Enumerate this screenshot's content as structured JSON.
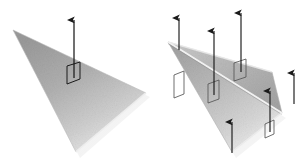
{
  "figure": {
    "background_color": "#ffffff",
    "width": 308,
    "height": 164,
    "panels": [
      {
        "name": "flat-surface-panel",
        "caption": "",
        "surface": {
          "name": "flat-triangle",
          "kind": "triangle",
          "fill_light": "#dcdcdc",
          "fill_dark": "#8d8d8d",
          "edge_color": "#b4b4b4",
          "vertices": [
            [
              13,
              30
            ],
            [
              146,
              93
            ],
            [
              76,
              152
            ]
          ]
        },
        "shadow": {
          "name": "triangle-drop-shadow",
          "color": "#e4e4e4",
          "vertices": [
            [
              18,
              36
            ],
            [
              150,
              97
            ],
            [
              80,
              158
            ]
          ]
        },
        "normals": [
          {
            "name": "normal-vector-1",
            "base": [
              74,
              76
            ],
            "tip": [
              74,
              13
            ],
            "length_px": 63,
            "color": "#1a1a1a"
          }
        ],
        "area_elements": [
          {
            "name": "area-element-1",
            "color": "#1a1a1a",
            "points": [
              [
                67,
                66
              ],
              [
                80,
                62
              ],
              [
                80,
                79
              ],
              [
                67,
                84
              ]
            ]
          }
        ]
      },
      {
        "name": "folded-surface-panel",
        "caption": "",
        "surface": {
          "name": "folded-surface",
          "kind": "two-facet-fold",
          "apex": [
            168,
            42
          ],
          "crease_end": [
            282,
            113
          ],
          "upper_facet": {
            "name": "upper-facet",
            "fill_light": "#d2d2d2",
            "fill_dark": "#9a9a9a",
            "vertices": [
              [
                168,
                42
              ],
              [
                282,
                113
              ],
              [
                272,
                73
              ]
            ]
          },
          "lower_facet": {
            "name": "lower-facet",
            "fill_light": "#e0e0e0",
            "fill_dark": "#8f8f8f",
            "vertices": [
              [
                168,
                42
              ],
              [
                282,
                113
              ],
              [
                232,
                152
              ]
            ]
          },
          "crease_color": "#f2f2f2",
          "edge_color": "#b0b0b0"
        },
        "shadow": {
          "name": "folded-drop-shadow",
          "color": "#e8e8e8",
          "vertices": [
            [
              172,
              48
            ],
            [
              286,
              118
            ],
            [
              236,
              158
            ]
          ]
        },
        "normals": [
          {
            "name": "normal-vector-1",
            "base": [
              179,
              48
            ],
            "tip": [
              179,
              11
            ],
            "length_px": 37,
            "color": "#1a1a1a"
          },
          {
            "name": "normal-vector-2",
            "base": [
              214,
              93
            ],
            "tip": [
              214,
              24
            ],
            "length_px": 69,
            "color": "#1a1a1a"
          },
          {
            "name": "normal-vector-3",
            "base": [
              241,
              70
            ],
            "tip": [
              241,
              6
            ],
            "length_px": 64,
            "color": "#1a1a1a"
          },
          {
            "name": "normal-vector-4",
            "base": [
              232,
              151
            ],
            "tip": [
              232,
              115
            ],
            "length_px": 36,
            "color": "#1a1a1a"
          },
          {
            "name": "normal-vector-5",
            "base": [
              270,
              130
            ],
            "tip": [
              270,
              84
            ],
            "length_px": 46,
            "color": "#1a1a1a"
          },
          {
            "name": "normal-vector-6",
            "base": [
              294,
              102
            ],
            "tip": [
              294,
              66
            ],
            "length_px": 36,
            "color": "#1a1a1a"
          }
        ],
        "area_elements": [
          {
            "name": "area-element-1",
            "color": "#6a6a6a",
            "points": [
              [
                174,
                75
              ],
              [
                184,
                71
              ],
              [
                184,
                94
              ],
              [
                174,
                98
              ]
            ]
          },
          {
            "name": "area-element-2",
            "color": "#6a6a6a",
            "points": [
              [
                208,
                84
              ],
              [
                219,
                80
              ],
              [
                219,
                99
              ],
              [
                208,
                103
              ]
            ]
          },
          {
            "name": "area-element-3",
            "color": "#6a6a6a",
            "points": [
              [
                234,
                63
              ],
              [
                246,
                59
              ],
              [
                246,
                77
              ],
              [
                234,
                81
              ]
            ]
          },
          {
            "name": "area-element-4",
            "color": "#6a6a6a",
            "points": [
              [
                265,
                124
              ],
              [
                274,
                120
              ],
              [
                274,
                134
              ],
              [
                265,
                138
              ]
            ]
          }
        ]
      }
    ]
  }
}
